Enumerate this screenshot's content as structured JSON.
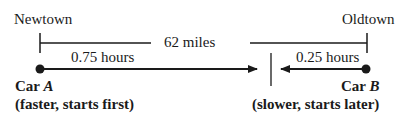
{
  "diagram": {
    "towns": {
      "left": "Newtown",
      "right": "Oldtown"
    },
    "distance_label": "62 miles",
    "car_a": {
      "time_label": "0.75 hours",
      "name_prefix": "Car ",
      "name_letter": "A",
      "description": "(faster, starts first)"
    },
    "car_b": {
      "time_label": "0.25 hours",
      "name_prefix": "Car ",
      "name_letter": "B",
      "description": "(slower, starts later)"
    },
    "colors": {
      "stroke": "#1a1a1a",
      "background": "#ffffff"
    }
  }
}
